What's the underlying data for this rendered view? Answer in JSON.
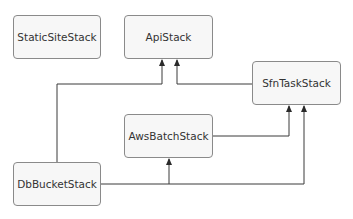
{
  "diagram": {
    "type": "dependency-graph",
    "nodes": [
      {
        "id": "static",
        "label": "StaticSiteStack",
        "x": 13,
        "y": 15,
        "w": 88,
        "h": 44
      },
      {
        "id": "api",
        "label": "ApiStack",
        "x": 124,
        "y": 15,
        "w": 89,
        "h": 44
      },
      {
        "id": "sfn",
        "label": "SfnTaskStack",
        "x": 252,
        "y": 61,
        "w": 89,
        "h": 44
      },
      {
        "id": "batch",
        "label": "AwsBatchStack",
        "x": 124,
        "y": 114,
        "w": 89,
        "h": 44
      },
      {
        "id": "db",
        "label": "DbBucketStack",
        "x": 13,
        "y": 162,
        "w": 88,
        "h": 44
      }
    ],
    "edges": [
      {
        "from": "DbBucketStack",
        "to": "ApiStack"
      },
      {
        "from": "SfnTaskStack",
        "to": "ApiStack"
      },
      {
        "from": "DbBucketStack",
        "to": "AwsBatchStack"
      },
      {
        "from": "AwsBatchStack",
        "to": "SfnTaskStack"
      },
      {
        "from": "DbBucketStack",
        "to": "SfnTaskStack"
      }
    ],
    "colors": {
      "line": "#3a3a3a",
      "node_fill": "#f7f7f7",
      "node_border": "#8a8a8a",
      "text": "#333333"
    }
  }
}
